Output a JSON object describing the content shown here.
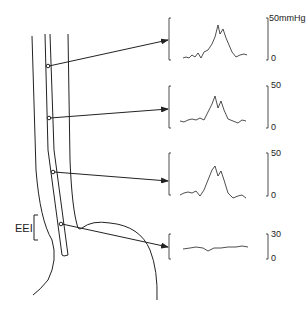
{
  "diagram": {
    "region_label": "EEI",
    "structures": [
      "esophagus",
      "catheter",
      "stomach"
    ],
    "recording_sites": 4
  },
  "traces": [
    {
      "scale_top": "50mmHg",
      "scale_bottom": "0",
      "shape": "peak"
    },
    {
      "scale_top": "50",
      "scale_bottom": "0",
      "shape": "peak"
    },
    {
      "scale_top": "50",
      "scale_bottom": "0",
      "shape": "peak"
    },
    {
      "scale_top": "30",
      "scale_bottom": "0",
      "shape": "flat"
    }
  ],
  "colors": {
    "line": "#222222",
    "background": "#ffffff"
  }
}
